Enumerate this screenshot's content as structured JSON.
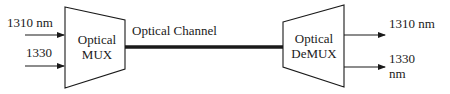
{
  "diagram": {
    "inputs": [
      {
        "label": "1310 nm"
      },
      {
        "label": "1330"
      }
    ],
    "mux": {
      "line1": "Optical",
      "line2": "MUX"
    },
    "channel": {
      "label": "Optical Channel"
    },
    "demux": {
      "line1": "Optical",
      "line2": "DeMUX"
    },
    "outputs": [
      {
        "label": "1310 nm"
      },
      {
        "label_line1": "1330",
        "label_line2": "nm"
      }
    ],
    "colors": {
      "stroke": "#1a1a1a",
      "background": "#ffffff"
    }
  }
}
